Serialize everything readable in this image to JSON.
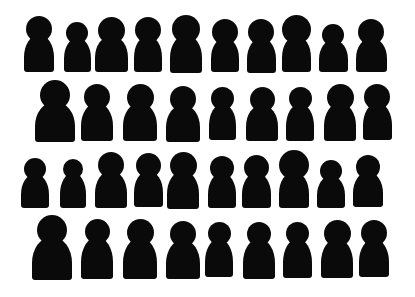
{
  "scene": {
    "description": "Hand-cut black paper silhouettes of people arranged in four rows on white background",
    "background_color": "#ffffff",
    "silhouette_color": "#0a0a0a",
    "rows": [
      {
        "name": "row-1",
        "figures": [
          {
            "x": 39,
            "head": 26,
            "body_w": 30,
            "top": 16,
            "h": 56
          },
          {
            "x": 77,
            "head": 22,
            "body_w": 27,
            "top": 22,
            "h": 50
          },
          {
            "x": 111,
            "head": 27,
            "body_w": 33,
            "top": 17,
            "h": 55
          },
          {
            "x": 148,
            "head": 26,
            "body_w": 28,
            "top": 17,
            "h": 55
          },
          {
            "x": 186,
            "head": 28,
            "body_w": 32,
            "top": 15,
            "h": 58
          },
          {
            "x": 225,
            "head": 26,
            "body_w": 28,
            "top": 19,
            "h": 53
          },
          {
            "x": 261,
            "head": 26,
            "body_w": 29,
            "top": 19,
            "h": 54
          },
          {
            "x": 296,
            "head": 29,
            "body_w": 29,
            "top": 15,
            "h": 57
          },
          {
            "x": 333,
            "head": 22,
            "body_w": 29,
            "top": 24,
            "h": 48
          },
          {
            "x": 371,
            "head": 26,
            "body_w": 31,
            "top": 19,
            "h": 53
          }
        ]
      },
      {
        "name": "row-2",
        "figures": [
          {
            "x": 55,
            "head": 30,
            "body_w": 40,
            "top": 80,
            "h": 62
          },
          {
            "x": 97,
            "head": 26,
            "body_w": 32,
            "top": 84,
            "h": 57
          },
          {
            "x": 140,
            "head": 27,
            "body_w": 34,
            "top": 84,
            "h": 57
          },
          {
            "x": 183,
            "head": 26,
            "body_w": 34,
            "top": 86,
            "h": 56
          },
          {
            "x": 222,
            "head": 23,
            "body_w": 27,
            "top": 87,
            "h": 53
          },
          {
            "x": 262,
            "head": 25,
            "body_w": 32,
            "top": 87,
            "h": 54
          },
          {
            "x": 300,
            "head": 23,
            "body_w": 28,
            "top": 87,
            "h": 54
          },
          {
            "x": 340,
            "head": 27,
            "body_w": 32,
            "top": 84,
            "h": 57
          },
          {
            "x": 377,
            "head": 26,
            "body_w": 29,
            "top": 84,
            "h": 56
          }
        ]
      },
      {
        "name": "row-3",
        "figures": [
          {
            "x": 35,
            "head": 22,
            "body_w": 28,
            "top": 158,
            "h": 50
          },
          {
            "x": 73,
            "head": 20,
            "body_w": 26,
            "top": 159,
            "h": 49
          },
          {
            "x": 111,
            "head": 26,
            "body_w": 32,
            "top": 152,
            "h": 56
          },
          {
            "x": 148,
            "head": 25,
            "body_w": 29,
            "top": 153,
            "h": 54
          },
          {
            "x": 183,
            "head": 27,
            "body_w": 32,
            "top": 152,
            "h": 57
          },
          {
            "x": 222,
            "head": 24,
            "body_w": 28,
            "top": 156,
            "h": 52
          },
          {
            "x": 256,
            "head": 25,
            "body_w": 29,
            "top": 155,
            "h": 53
          },
          {
            "x": 294,
            "head": 30,
            "body_w": 30,
            "top": 150,
            "h": 58
          },
          {
            "x": 331,
            "head": 22,
            "body_w": 28,
            "top": 160,
            "h": 48
          },
          {
            "x": 368,
            "head": 24,
            "body_w": 30,
            "top": 155,
            "h": 52
          }
        ]
      },
      {
        "name": "row-4",
        "figures": [
          {
            "x": 52,
            "head": 30,
            "body_w": 40,
            "top": 215,
            "h": 65
          },
          {
            "x": 97,
            "head": 25,
            "body_w": 32,
            "top": 219,
            "h": 60
          },
          {
            "x": 140,
            "head": 27,
            "body_w": 34,
            "top": 219,
            "h": 60
          },
          {
            "x": 183,
            "head": 26,
            "body_w": 34,
            "top": 221,
            "h": 58
          },
          {
            "x": 219,
            "head": 23,
            "body_w": 28,
            "top": 222,
            "h": 55
          },
          {
            "x": 259,
            "head": 24,
            "body_w": 32,
            "top": 222,
            "h": 57
          },
          {
            "x": 297,
            "head": 23,
            "body_w": 29,
            "top": 222,
            "h": 56
          },
          {
            "x": 337,
            "head": 27,
            "body_w": 32,
            "top": 220,
            "h": 58
          },
          {
            "x": 374,
            "head": 26,
            "body_w": 30,
            "top": 220,
            "h": 57
          }
        ]
      }
    ]
  }
}
